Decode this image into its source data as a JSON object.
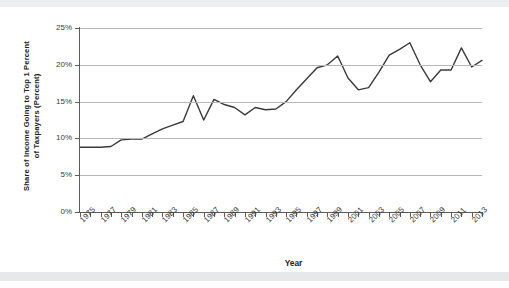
{
  "chart_data": {
    "type": "line",
    "title": "",
    "xlabel": "Year",
    "ylabel": "Share of Income Going to Top 1 Percent of Taxpayers (Percent)",
    "ylabel_line1": "Share of Income Going to Top 1 Percent",
    "ylabel_line2": "of Taxpayers (Percent)",
    "ylim": [
      0,
      25
    ],
    "yticks": [
      0,
      5,
      10,
      15,
      20,
      25
    ],
    "ytick_labels": [
      "0%",
      "5%",
      "10%",
      "15%",
      "20%",
      "25%"
    ],
    "xlim": [
      1975,
      2014
    ],
    "xtick_years": [
      1975,
      1976,
      1977,
      1978,
      1979,
      1980,
      1981,
      1982,
      1983,
      1984,
      1985,
      1986,
      1987,
      1988,
      1989,
      1990,
      1991,
      1992,
      1993,
      1994,
      1995,
      1996,
      1997,
      1998,
      1999,
      2000,
      2001,
      2002,
      2003,
      2004,
      2005,
      2006,
      2007,
      2008,
      2009,
      2010,
      2011,
      2012,
      2013,
      2014
    ],
    "xtick_labels": [
      "1975",
      "1977",
      "1979",
      "1981",
      "1983",
      "1985",
      "1987",
      "1989",
      "1991",
      "1993",
      "1995",
      "1997",
      "1999",
      "2001",
      "2003",
      "2005",
      "2007",
      "2009",
      "2011",
      "2013"
    ],
    "grid": "horizontal",
    "legend": "none",
    "line_color": "#3a3a3a",
    "gridline_color": "#b7b7b7",
    "axis_color": "#5c5c5c",
    "x": [
      1975,
      1976,
      1977,
      1978,
      1979,
      1980,
      1981,
      1982,
      1983,
      1984,
      1985,
      1986,
      1987,
      1988,
      1989,
      1990,
      1991,
      1992,
      1993,
      1994,
      1995,
      1996,
      1997,
      1998,
      1999,
      2000,
      2001,
      2002,
      2003,
      2004,
      2005,
      2006,
      2007,
      2008,
      2009,
      2010,
      2011,
      2012,
      2013,
      2014
    ],
    "values": [
      8.8,
      8.8,
      8.8,
      8.9,
      9.8,
      9.9,
      9.9,
      10.6,
      11.3,
      11.8,
      12.3,
      15.8,
      12.5,
      15.3,
      14.6,
      14.2,
      13.2,
      14.2,
      13.9,
      14.0,
      15.0,
      16.6,
      18.1,
      19.6,
      20.0,
      21.2,
      18.2,
      16.6,
      16.9,
      19.0,
      21.3,
      22.1,
      23.0,
      20.0,
      17.7,
      19.3,
      19.3,
      22.3,
      19.7,
      20.6
    ],
    "series_name": "Share of income going to top 1 percent of taxpayers"
  },
  "figure": {
    "ytitle_line1": "Share of Income Going to Top 1 Percent",
    "ytitle_line2": "of Taxpayers (Percent)",
    "xtitle": "Year"
  }
}
